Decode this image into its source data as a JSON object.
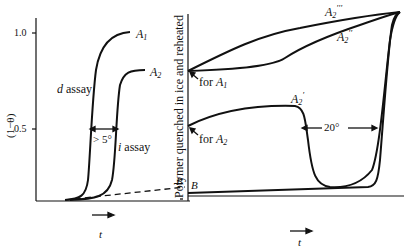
{
  "left_panel": {
    "y_axis_label": "(1−θ)",
    "y_ticks": [
      "1.0",
      "0.5"
    ],
    "curve_labels": {
      "a1": "A",
      "a1_sub": "1",
      "a2": "A",
      "a2_sub": "2"
    },
    "d_assay": {
      "var": "d",
      "text": " assay"
    },
    "i_assay": {
      "var": "i",
      "text": " assay"
    },
    "gap_label": "> 5°",
    "baseline_label": "B",
    "x_label": "t"
  },
  "right_panel": {
    "vertical_caption": "Polymer quenched in ice and reheated",
    "curve_labels": {
      "a2_triple": "A",
      "a2_triple_sub": "2",
      "a2_triple_prime": "′′′",
      "a2_double": "A",
      "a2_double_sub": "2",
      "a2_double_prime": "′′",
      "a2_single": "A",
      "a2_single_sub": "2",
      "a2_single_prime": "′"
    },
    "for_a1": {
      "text": "for ",
      "var": "A",
      "sub": "1"
    },
    "for_a2": {
      "text": "for ",
      "var": "A",
      "sub": "2"
    },
    "gap_label": "20°",
    "baseline_label": "B",
    "x_label": "t"
  }
}
